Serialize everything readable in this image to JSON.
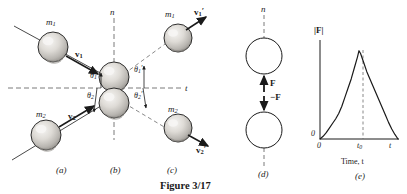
{
  "figure": {
    "caption": "Figure 3/17",
    "panels": [
      {
        "key": "a",
        "label": "(a)"
      },
      {
        "key": "b",
        "label": "(b)"
      },
      {
        "key": "c",
        "label": "(c)"
      },
      {
        "key": "d",
        "label": "(d)"
      },
      {
        "key": "e",
        "label": "(e)"
      }
    ]
  },
  "impact_diagram": {
    "axis_n_label": "n",
    "axis_t_label": "t",
    "masses": {
      "m1_incoming": "m",
      "m1_incoming_sub": "1",
      "m1_outgoing": "m",
      "m1_outgoing_sub": "1",
      "m2_incoming": "m",
      "m2_incoming_sub": "2",
      "m2_outgoing": "m",
      "m2_outgoing_sub": "2"
    },
    "velocities": {
      "v1": "v",
      "v1_sub": "1",
      "v1_prime": "v",
      "v1_prime_sub": "1",
      "v1_prime_mark": "′",
      "v2": "v",
      "v2_sub": "2",
      "v2_prime": "v",
      "v2_prime_sub": "2",
      "v2_prime_mark": "′"
    },
    "angles": {
      "theta1": "θ",
      "theta1_sub": "1",
      "theta1_prime": "θ",
      "theta1_prime_sub": "1",
      "theta1_prime_mark": "′",
      "theta2": "θ",
      "theta2_sub": "2",
      "theta2_prime": "θ",
      "theta2_prime_sub": "2",
      "theta2_prime_mark": "′"
    }
  },
  "force_pair": {
    "axis_n_label": "n",
    "force_up": "F",
    "force_down": "−F"
  },
  "chart_data": {
    "type": "line",
    "title": "",
    "ylabel": "|F|",
    "xlabel": "Time, t",
    "x_origin_label": "0",
    "y_origin_label": "0",
    "x_tick_labels": [
      "0",
      "t₀",
      "t"
    ],
    "x_peak_label_base": "t",
    "x_peak_label_sub": "0",
    "x_end_label": "t",
    "annotation": "dashed vertical line at t₀ marking peak force",
    "xlim": [
      0,
      1
    ],
    "ylim": [
      0,
      1
    ],
    "grid": false,
    "legend": false,
    "x": [
      0.0,
      0.04,
      0.08,
      0.12,
      0.16,
      0.2,
      0.24,
      0.28,
      0.32,
      0.36,
      0.4,
      0.44,
      0.48,
      0.5,
      0.52,
      0.56,
      0.6,
      0.64,
      0.68,
      0.72,
      0.76,
      0.8,
      0.84,
      0.88,
      0.92,
      0.96,
      1.0
    ],
    "values": [
      0.0,
      0.03,
      0.07,
      0.12,
      0.17,
      0.22,
      0.28,
      0.36,
      0.46,
      0.56,
      0.66,
      0.78,
      0.9,
      0.97,
      0.94,
      0.84,
      0.74,
      0.66,
      0.58,
      0.5,
      0.42,
      0.34,
      0.26,
      0.18,
      0.11,
      0.05,
      0.0
    ],
    "peak_x": 0.5,
    "peak_y": 0.97
  },
  "colors": {
    "ink": "#1a1a1a",
    "sphere_fill": "#d8d6d2",
    "sphere_shade": "#a6a39e",
    "sphere_highlight": "#f2f1ef",
    "dashed": "#6b6b6b"
  }
}
